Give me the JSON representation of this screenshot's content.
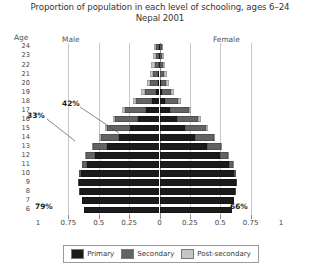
{
  "title": {
    "line1": "Proportion of population in each level of schooling, ages 6–24",
    "line2": "Nepal 2001"
  },
  "headers": {
    "age": "Age",
    "male": "Male",
    "female": "Female"
  },
  "legend": {
    "items": [
      {
        "label": "Primary",
        "color": "#1b1b1b",
        "key": "primary"
      },
      {
        "label": "Secondary",
        "color": "#636363",
        "key": "secondary"
      },
      {
        "label": "Post-secondary",
        "color": "#c6c6c6",
        "key": "post"
      }
    ]
  },
  "annotations": [
    {
      "name": "male-age6-total",
      "text": "79%"
    },
    {
      "name": "female-age6-total",
      "text": "66%"
    },
    {
      "name": "male-age15-total",
      "text": "33%"
    },
    {
      "name": "female-age16-total",
      "text": "42%"
    }
  ],
  "chart_data": {
    "type": "bar",
    "subtype": "population-pyramid-stacked",
    "title": "Proportion of population in each level of schooling, ages 6–24",
    "subtitle": "Nepal 2001",
    "xlabel": "",
    "ylabel": "Age",
    "grid": true,
    "legend_position": "bottom",
    "xticks": [
      0.75,
      0.5,
      0.25,
      0,
      0.25,
      0.5,
      0.75,
      1
    ],
    "xtick_labels": [
      "0.75",
      "0.5",
      "0.25",
      "0",
      "0.25",
      "0.5",
      "0.75",
      "1"
    ],
    "xlim": [
      -0.75,
      0.75
    ],
    "ages": [
      24,
      23,
      22,
      21,
      20,
      19,
      18,
      17,
      16,
      15,
      14,
      13,
      12,
      11,
      10,
      9,
      8,
      7,
      6
    ],
    "series_order": [
      "primary",
      "secondary",
      "post"
    ],
    "series_labels": {
      "primary": "Primary",
      "secondary": "Secondary",
      "post": "Post-secondary"
    },
    "male": {
      "primary": [
        0.005,
        0.005,
        0.008,
        0.01,
        0.015,
        0.03,
        0.06,
        0.11,
        0.175,
        0.245,
        0.33,
        0.43,
        0.53,
        0.6,
        0.645,
        0.66,
        0.655,
        0.64,
        0.62
      ],
      "secondary": [
        0.02,
        0.024,
        0.03,
        0.042,
        0.06,
        0.09,
        0.13,
        0.175,
        0.19,
        0.185,
        0.155,
        0.12,
        0.075,
        0.04,
        0.02,
        0.01,
        0.005,
        0.0,
        0.0
      ],
      "post": [
        0.022,
        0.025,
        0.028,
        0.03,
        0.032,
        0.032,
        0.03,
        0.025,
        0.02,
        0.015,
        0.012,
        0.008,
        0.005,
        0.002,
        0.0,
        0.0,
        0.0,
        0.0,
        0.0
      ]
    },
    "female": {
      "primary": [
        0.004,
        0.004,
        0.006,
        0.008,
        0.012,
        0.024,
        0.048,
        0.09,
        0.145,
        0.21,
        0.295,
        0.395,
        0.495,
        0.57,
        0.615,
        0.63,
        0.625,
        0.615,
        0.6
      ],
      "secondary": [
        0.014,
        0.016,
        0.02,
        0.03,
        0.045,
        0.07,
        0.105,
        0.15,
        0.175,
        0.175,
        0.15,
        0.115,
        0.072,
        0.038,
        0.018,
        0.009,
        0.004,
        0.0,
        0.0
      ],
      "post": [
        0.014,
        0.016,
        0.018,
        0.02,
        0.022,
        0.024,
        0.024,
        0.022,
        0.018,
        0.014,
        0.01,
        0.007,
        0.004,
        0.002,
        0.0,
        0.0,
        0.0,
        0.0,
        0.0
      ]
    },
    "data_labels": {
      "male_age6_total": "79%",
      "female_age6_total": "66%",
      "male_age15_total": "33%",
      "female_age16_total": "42%"
    }
  }
}
